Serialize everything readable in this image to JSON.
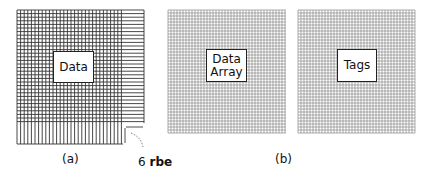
{
  "figure_a": {
    "caption": "(a)",
    "box_label": "Data",
    "annotation_number": "6",
    "annotation_unit": "rbe",
    "grid": {
      "x": 17,
      "y": 10,
      "w": 127,
      "h": 134,
      "cell": 3.6,
      "h_only_cols_width": 21,
      "v_only_rows_height": 21
    }
  },
  "figure_b": {
    "caption": "(b)",
    "data_array": {
      "label_line1": "Data",
      "label_line2": "Array",
      "grid": {
        "x": 168,
        "y": 10,
        "w": 118,
        "h": 123,
        "cell": 3.0
      }
    },
    "tags": {
      "label": "Tags",
      "grid": {
        "x": 298,
        "y": 10,
        "w": 117,
        "h": 123,
        "cell": 3.0
      }
    }
  },
  "colors": {
    "dense_line": "#333333",
    "light_line": "#888888",
    "text": "#111111"
  }
}
